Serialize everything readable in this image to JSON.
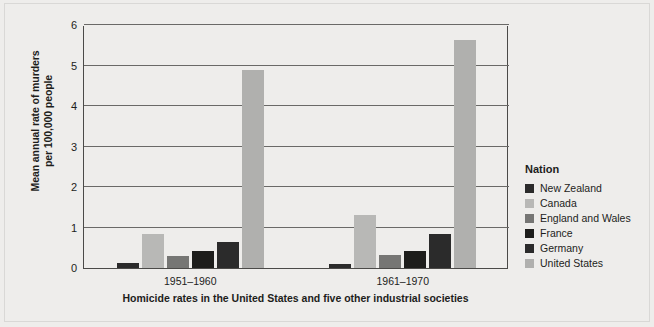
{
  "chart_data": {
    "type": "bar",
    "title": "",
    "caption": "Homicide rates in the United States and five other industrial societies",
    "xlabel": "",
    "ylabel": "Mean annual rate of murders per 100,000 people",
    "ylabel_line1": "Mean annual rate of murders",
    "ylabel_line2": "per 100,000 people",
    "categories": [
      "1951–1960",
      "1961–1970"
    ],
    "yticks": [
      0,
      1,
      2,
      3,
      4,
      5,
      6
    ],
    "ylim": [
      0,
      6
    ],
    "grid": true,
    "legend_position": "right",
    "legend_title": "Nation",
    "series": [
      {
        "name": "New Zealand",
        "color": "#2b2b2b",
        "values": [
          0.12,
          0.09
        ]
      },
      {
        "name": "Canada",
        "color": "#b8b8b6",
        "values": [
          0.83,
          1.3
        ]
      },
      {
        "name": "England and Wales",
        "color": "#767674",
        "values": [
          0.3,
          0.31
        ]
      },
      {
        "name": "France",
        "color": "#1d1d1b",
        "values": [
          0.42,
          0.42
        ]
      },
      {
        "name": "Germany",
        "color": "#2b2b2b",
        "values": [
          0.64,
          0.85
        ]
      },
      {
        "name": "United States",
        "color": "#b0b0ae",
        "values": [
          4.9,
          5.62
        ]
      }
    ]
  },
  "colors": {
    "background": "#eeedeb",
    "axis": "#4b4a48",
    "grid": "#6a6967",
    "text": "#1d1d1b"
  }
}
